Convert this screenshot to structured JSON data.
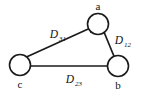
{
  "figure": {
    "type": "directed-graph-triangle",
    "background_color": "#ffffff",
    "stroke_color": "#1a1a1a"
  },
  "nodes": [
    {
      "id": "a",
      "label": "a",
      "cx": 98,
      "cy": 24,
      "r": 10.5,
      "label_x": 98,
      "label_y": 10
    },
    {
      "id": "b",
      "label": "b",
      "cx": 118,
      "cy": 66,
      "r": 10.5,
      "label_x": 118,
      "label_y": 88
    },
    {
      "id": "c",
      "label": "c",
      "cx": 20,
      "cy": 65,
      "r": 10.5,
      "label_x": 20,
      "label_y": 87
    }
  ],
  "edges": [
    {
      "id": "c-to-a",
      "from": "c",
      "to": "a",
      "label_main": "D",
      "label_sub": "31",
      "label_x": 56,
      "label_y": 38
    },
    {
      "id": "a-to-b",
      "from": "a",
      "to": "b",
      "label_main": "D",
      "label_sub": "12",
      "label_x": 121,
      "label_y": 44
    },
    {
      "id": "b-to-c",
      "from": "b",
      "to": "c",
      "label_main": "D",
      "label_sub": "23",
      "label_x": 72,
      "label_y": 83
    }
  ]
}
